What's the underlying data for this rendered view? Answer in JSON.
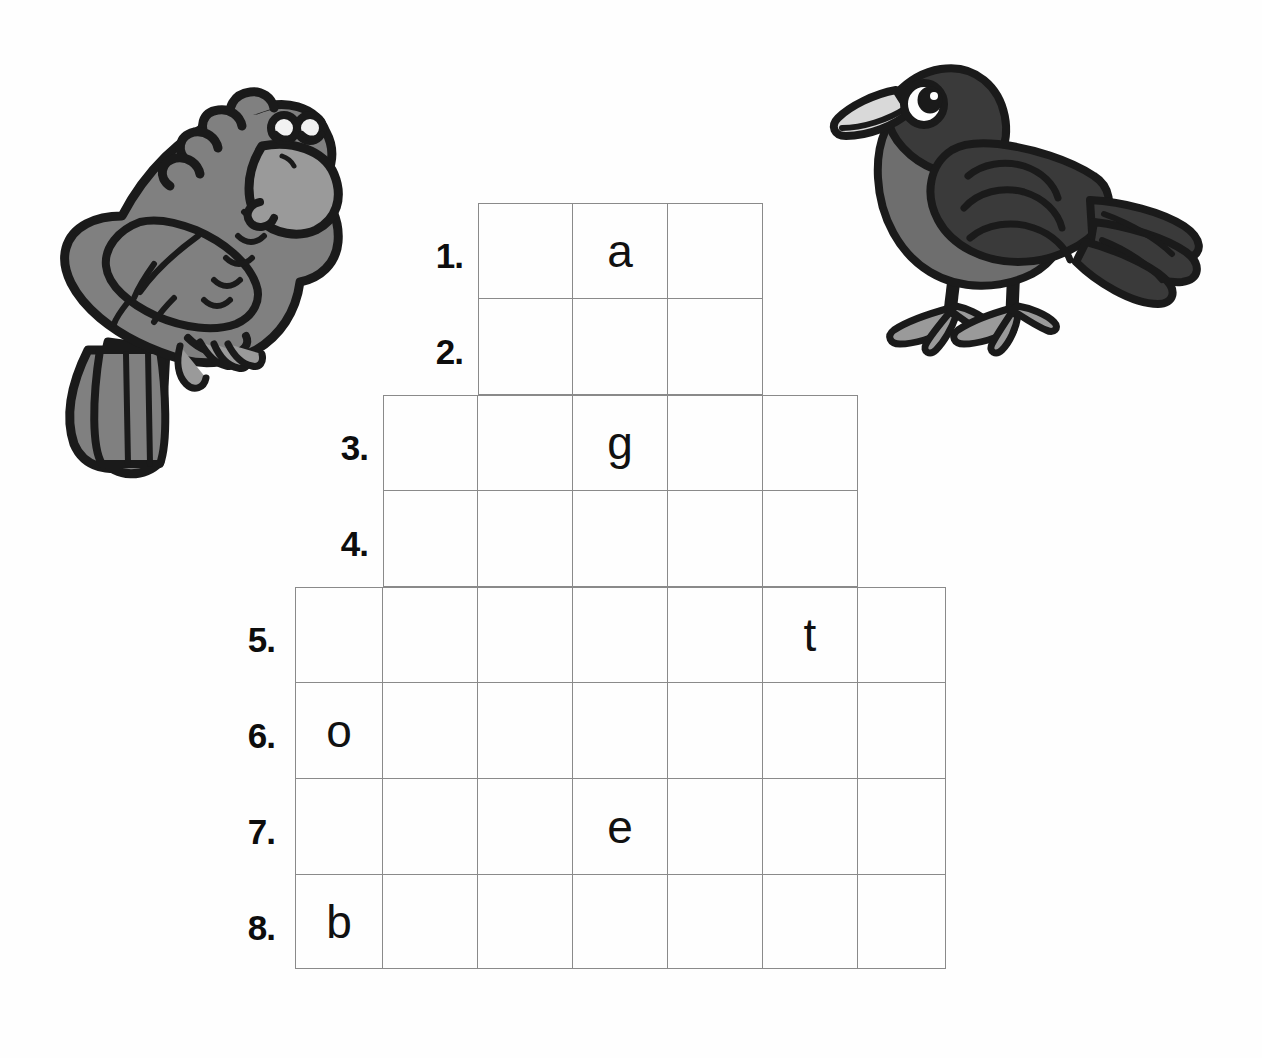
{
  "page": {
    "kind": "worksheet-crossword-grid",
    "background_color": "#fefefe",
    "grid_line_color": "#8a8a8a",
    "letter_color": "#111111",
    "label_color": "#0d0d0d"
  },
  "illustrations": [
    {
      "name": "parrot-illustration",
      "label": "parrot",
      "colors": {
        "outline": "#1a1a1a",
        "body": "#808080",
        "beak": "#9a9a9a",
        "eye_white": "#f2f2f2"
      }
    },
    {
      "name": "crow-illustration",
      "label": "crow",
      "colors": {
        "outline": "#1a1a1a",
        "body": "#6e6e6e",
        "wing": "#3a3a3a",
        "beak": "#d9d9d9",
        "eye_white": "#ffffff",
        "legs": "#9a9a9a"
      }
    }
  ],
  "grid": {
    "column_count": 7,
    "row_count": 8,
    "rows": [
      {
        "number": "1.",
        "start_col": 3,
        "cells": [
          "",
          "a",
          ""
        ]
      },
      {
        "number": "2.",
        "start_col": 3,
        "cells": [
          "",
          "",
          ""
        ]
      },
      {
        "number": "3.",
        "start_col": 2,
        "cells": [
          "",
          "",
          "g",
          "",
          ""
        ]
      },
      {
        "number": "4.",
        "start_col": 2,
        "cells": [
          "",
          "",
          "",
          "",
          ""
        ]
      },
      {
        "number": "5.",
        "start_col": 1,
        "cells": [
          "",
          "",
          "",
          "",
          "",
          "t",
          ""
        ]
      },
      {
        "number": "6.",
        "start_col": 1,
        "cells": [
          "o",
          "",
          "",
          "",
          "",
          "",
          ""
        ]
      },
      {
        "number": "7.",
        "start_col": 1,
        "cells": [
          "",
          "",
          "",
          "e",
          "",
          "",
          ""
        ]
      },
      {
        "number": "8.",
        "start_col": 1,
        "cells": [
          "b",
          "",
          "",
          "",
          "",
          "",
          ""
        ]
      }
    ]
  }
}
